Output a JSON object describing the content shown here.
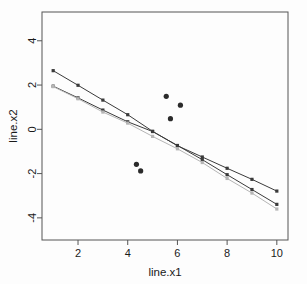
{
  "chart_data": {
    "type": "line",
    "title": "",
    "subtitle": "",
    "xlabel": "line.x1",
    "ylabel": "line.x2",
    "xlim": [
      0.55,
      10.45
    ],
    "ylim": [
      -5.0,
      5.3
    ],
    "xticks": [
      2,
      4,
      6,
      8,
      10
    ],
    "yticks": [
      4,
      2,
      0,
      -2,
      -4
    ],
    "xtick_labels": [
      "2",
      "4",
      "6",
      "8",
      "10"
    ],
    "ytick_labels": [
      "4",
      "2",
      "0",
      "-2",
      "-4"
    ],
    "grid": false,
    "legend": "none",
    "x": [
      1,
      2,
      3,
      4,
      5,
      6,
      7,
      8,
      9,
      10
    ],
    "series": [
      {
        "name": "line-series-upper",
        "color": "#3a3a3a",
        "marker": "square",
        "values": [
          2.65,
          1.99,
          1.32,
          0.66,
          -0.09,
          -0.74,
          -1.25,
          -1.76,
          -2.26,
          -2.79
        ]
      },
      {
        "name": "line-series-middle",
        "color": "#3a3a3a",
        "marker": "square",
        "values": [
          1.95,
          1.42,
          0.87,
          0.34,
          -0.1,
          -0.73,
          -1.37,
          -2.05,
          -2.72,
          -3.39
        ]
      },
      {
        "name": "line-series-lower",
        "color": "#b5b5b5",
        "marker": "square",
        "values": [
          1.93,
          1.38,
          0.78,
          0.28,
          -0.32,
          -0.88,
          -1.5,
          -2.22,
          -2.88,
          -3.6
        ]
      }
    ],
    "scatter_points": {
      "name": "outlier-points",
      "color": "#2b2b2b",
      "marker": "circle",
      "points": [
        {
          "x": 4.35,
          "y": -1.58
        },
        {
          "x": 4.52,
          "y": -1.88
        },
        {
          "x": 5.55,
          "y": 1.49
        },
        {
          "x": 5.72,
          "y": 0.48
        },
        {
          "x": 6.12,
          "y": 1.09
        }
      ]
    }
  }
}
